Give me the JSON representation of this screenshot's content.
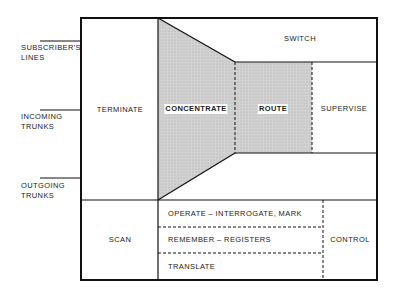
{
  "inputs": {
    "subscribers_lines": [
      "SUBSCRIBER'S",
      "LINES"
    ],
    "incoming_trunks": [
      "INCOMING",
      "TRUNKS"
    ],
    "outgoing_trunks": [
      "OUTGOING",
      "TRUNKS"
    ]
  },
  "blocks": {
    "terminate": "TERMINATE",
    "switch": "SWITCH",
    "concentrate": "CONCENTRATE",
    "route": "ROUTE",
    "supervise": "SUPERVISE",
    "scan": "SCAN",
    "operate": "OPERATE – INTERROGATE, MARK",
    "remember": "REMEMBER – REGISTERS",
    "translate": "TRANSLATE",
    "control": "CONTROL"
  },
  "colors": {
    "line": "#111111",
    "shade": "#c8c8c8",
    "background": "#ffffff"
  }
}
